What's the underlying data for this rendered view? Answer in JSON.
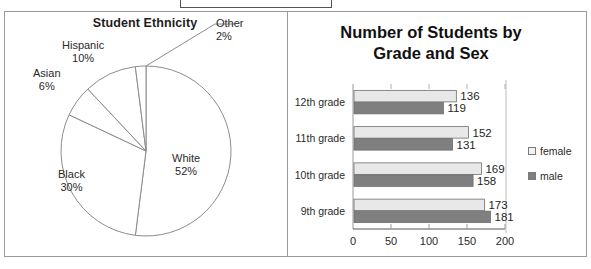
{
  "topbox": {
    "text": ""
  },
  "pie_panel": {
    "title": "Student Ethnicity",
    "labels": {
      "other": {
        "name": "Other",
        "pct": "2%"
      },
      "hispanic": {
        "name": "Hispanic",
        "pct": "10%"
      },
      "asian": {
        "name": "Asian",
        "pct": "6%"
      },
      "black": {
        "name": "Black",
        "pct": "30%"
      },
      "white": {
        "name": "White",
        "pct": "52%"
      }
    }
  },
  "bar_panel": {
    "title_line1": "Number of Students by",
    "title_line2": "Grade and Sex",
    "legend": [
      {
        "label": "female",
        "color": "#f2f2f2"
      },
      {
        "label": "male",
        "color": "#7f7f7f"
      }
    ]
  },
  "chart_data": [
    {
      "type": "pie",
      "title": "Student Ethnicity",
      "categories": [
        "White",
        "Black",
        "Asian",
        "Hispanic",
        "Other"
      ],
      "values": [
        52,
        30,
        6,
        10,
        2
      ],
      "unit": "%",
      "labels": [
        "White 52%",
        "Black 30%",
        "Asian 6%",
        "Hispanic 10%",
        "Other 2%"
      ],
      "start_angle_deg": 0,
      "direction": "clockwise",
      "slice_fill": "#ffffff",
      "slice_stroke": "#8c8c8c",
      "legend": "none",
      "data_labels": "outside"
    },
    {
      "type": "bar",
      "orientation": "horizontal",
      "title": "Number of Students by Grade and Sex",
      "categories": [
        "12th grade",
        "11th grade",
        "10th grade",
        "9th grade"
      ],
      "series": [
        {
          "name": "female",
          "values": [
            136,
            152,
            169,
            173
          ],
          "color": "#e8e8e8"
        },
        {
          "name": "male",
          "values": [
            119,
            131,
            158,
            181
          ],
          "color": "#7f7f7f"
        }
      ],
      "xlabel": "",
      "ylabel": "",
      "xlim": [
        0,
        200
      ],
      "xticks": [
        0,
        50,
        100,
        150,
        200
      ],
      "xtick_labels": [
        "0",
        "50",
        "100",
        "150",
        "200"
      ],
      "grid": false,
      "legend_position": "right",
      "data_labels": true
    }
  ]
}
